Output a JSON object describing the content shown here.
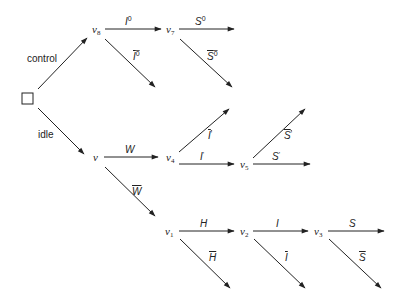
{
  "root": {
    "label": "",
    "shape": "square"
  },
  "nodes": {
    "v": {
      "base": "v",
      "sub": ""
    },
    "v1": {
      "base": "v",
      "sub": "1"
    },
    "v2": {
      "base": "v",
      "sub": "2"
    },
    "v3": {
      "base": "v",
      "sub": "3"
    },
    "v4": {
      "base": "v",
      "sub": "4"
    },
    "v5": {
      "base": "v",
      "sub": "5"
    },
    "v7": {
      "base": "v",
      "sub": "7"
    },
    "v8": {
      "base": "v",
      "sub": "8"
    }
  },
  "edges": {
    "control": {
      "label": "control"
    },
    "idle": {
      "label": "idle"
    },
    "I0": {
      "base": "I",
      "sup": "0",
      "bar": false
    },
    "I0bar": {
      "base": "I",
      "sup": "0",
      "bar": true
    },
    "S0": {
      "base": "S",
      "sup": "0",
      "bar": false
    },
    "S0bar": {
      "base": "S",
      "sup": "0",
      "bar": true
    },
    "W": {
      "base": "W",
      "bar": false
    },
    "Wbar": {
      "base": "W",
      "bar": true
    },
    "Iprime": {
      "base": "I",
      "sup": "'",
      "bar": false
    },
    "Iprimebar": {
      "base": "I",
      "sup": "'",
      "bar": true
    },
    "Sprime": {
      "base": "S",
      "sup": "'",
      "bar": false
    },
    "Sprimebar": {
      "base": "S",
      "sup": "'",
      "bar": true
    },
    "H": {
      "base": "H",
      "bar": false
    },
    "Hbar": {
      "base": "H",
      "bar": true
    },
    "I": {
      "base": "I",
      "bar": false
    },
    "Ibar": {
      "base": "I",
      "bar": true
    },
    "S": {
      "base": "S",
      "bar": false
    },
    "Sbar": {
      "base": "S",
      "bar": true
    }
  },
  "colors": {
    "line": "#222222",
    "background": "#ffffff"
  }
}
